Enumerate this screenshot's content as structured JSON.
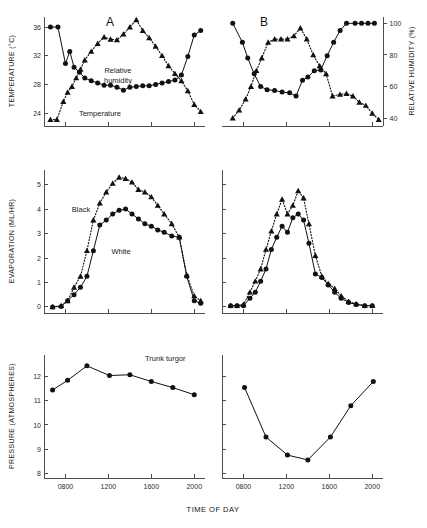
{
  "figure": {
    "panel_a_letter": "A",
    "panel_b_letter": "B",
    "x_axis_title": "TIME OF DAY",
    "y_axis_title_top": "TEMPERATURE (°C)",
    "y_axis_title_top_right": "RELATIVE HUMIDITY (%)",
    "y_axis_title_middle": "EVAPORATION (ML/HR)",
    "y_axis_title_bottom": "PRESSURE (ATMOSPHERES)",
    "annotations": {
      "relative_humidity": "Relative\nhumidity",
      "relative_humidity_line1": "Relative",
      "relative_humidity_line2": "humidity",
      "temperature": "Temperature",
      "black": "Black",
      "white": "White",
      "trunk_turgor": "Trunk turgor"
    }
  },
  "chart_data": [
    {
      "id": "panel-a-top",
      "type": "line",
      "title": "A",
      "xlabel": "TIME OF DAY",
      "ylabel": "TEMPERATURE (°C)",
      "xlim": [
        600,
        2100
      ],
      "ylim": [
        22.2,
        37.4
      ],
      "xticks": [
        800,
        1200,
        1600,
        2000
      ],
      "xticklabels": [
        "0800",
        "1200",
        "1600",
        "2000"
      ],
      "yticks": [
        24,
        28,
        32,
        36
      ],
      "yticklabels": [
        "24",
        "28",
        "32",
        "36"
      ],
      "grid": false,
      "legend": "inline-annotation",
      "series": [
        {
          "name": "Relative humidity",
          "marker": "circle",
          "linestyle": "solid",
          "x": [
            660,
            730,
            800,
            840,
            880,
            930,
            980,
            1040,
            1100,
            1160,
            1220,
            1280,
            1340,
            1400,
            1460,
            1520,
            1580,
            1640,
            1700,
            1760,
            1820,
            1880,
            1940,
            2000,
            2060
          ],
          "y": [
            36.0,
            36.0,
            30.9,
            32.6,
            30.4,
            29.7,
            28.9,
            28.5,
            28.2,
            27.9,
            27.9,
            27.6,
            27.2,
            27.6,
            27.7,
            27.8,
            27.8,
            28.0,
            28.2,
            28.4,
            28.6,
            29.3,
            31.9,
            34.9,
            35.5
          ]
        },
        {
          "name": "Temperature",
          "marker": "triangle",
          "linestyle": "dotted",
          "x": [
            660,
            720,
            780,
            820,
            860,
            900,
            940,
            980,
            1040,
            1100,
            1160,
            1220,
            1280,
            1340,
            1400,
            1460,
            1520,
            1580,
            1640,
            1700,
            1760,
            1820,
            1880,
            1940,
            2000,
            2060
          ],
          "y": [
            23.1,
            23.1,
            25.6,
            26.9,
            27.7,
            28.9,
            30.1,
            31.4,
            32.6,
            33.7,
            34.6,
            34.3,
            34.2,
            35.0,
            36.0,
            37.0,
            35.5,
            34.5,
            33.3,
            32.0,
            30.6,
            29.5,
            28.5,
            27.1,
            25.2,
            24.2
          ]
        }
      ]
    },
    {
      "id": "panel-b-top",
      "type": "line",
      "title": "B",
      "xlabel": "TIME OF DAY",
      "ylabel": "RELATIVE HUMIDITY (%)",
      "xlim": [
        600,
        2100
      ],
      "ylim": [
        35,
        104
      ],
      "xticks": [
        800,
        1200,
        1600,
        2000
      ],
      "xticklabels": [
        "0800",
        "1200",
        "1600",
        "2000"
      ],
      "yticks": [
        40,
        60,
        80,
        100
      ],
      "yticklabels": [
        "40",
        "60",
        "80",
        "100"
      ],
      "grid": false,
      "series": [
        {
          "name": "Relative humidity",
          "marker": "circle",
          "linestyle": "solid",
          "x": [
            700,
            790,
            840,
            900,
            960,
            1020,
            1090,
            1160,
            1230,
            1290,
            1350,
            1400,
            1460,
            1520,
            1580,
            1640,
            1700,
            1760,
            1840,
            1900,
            1960,
            2020
          ],
          "y": [
            100.0,
            88.0,
            78.0,
            68.0,
            60.0,
            58.0,
            57.5,
            56.5,
            56.0,
            54.0,
            64.0,
            66.0,
            70.0,
            70.5,
            79.5,
            88.0,
            95.5,
            100.0,
            100.0,
            100.0,
            100.0,
            100.0
          ]
        },
        {
          "name": "Temperature",
          "marker": "triangle",
          "linestyle": "dotted",
          "x": [
            700,
            760,
            820,
            870,
            920,
            970,
            1030,
            1090,
            1150,
            1210,
            1270,
            1330,
            1390,
            1450,
            1510,
            1570,
            1630,
            1700,
            1760,
            1820,
            1880,
            1940,
            2000,
            2060
          ],
          "y": [
            40.0,
            45.0,
            52.0,
            60.0,
            70.0,
            78.0,
            88.0,
            90.0,
            90.0,
            90.0,
            92.0,
            97.0,
            90.0,
            80.0,
            73.0,
            68.0,
            54.0,
            55.0,
            55.5,
            54.0,
            50.0,
            48.0,
            43.0,
            39.0
          ]
        }
      ]
    },
    {
      "id": "panel-a-middle",
      "type": "line",
      "title": "",
      "xlabel": "TIME OF DAY",
      "ylabel": "EVAPORATION (ML/HR)",
      "xlim": [
        600,
        2100
      ],
      "ylim": [
        -0.25,
        5.6
      ],
      "xticks": [
        800,
        1200,
        1600,
        2000
      ],
      "xticklabels": [
        "0800",
        "1200",
        "1600",
        "2000"
      ],
      "yticks": [
        0,
        1,
        2,
        3,
        4,
        5
      ],
      "yticklabels": [
        "0",
        "1",
        "2",
        "3",
        "4",
        "5"
      ],
      "grid": false,
      "series": [
        {
          "name": "Black",
          "marker": "triangle",
          "linestyle": "dotted",
          "x": [
            680,
            760,
            820,
            880,
            940,
            1000,
            1060,
            1120,
            1180,
            1240,
            1300,
            1360,
            1420,
            1480,
            1540,
            1600,
            1660,
            1720,
            1790,
            1860,
            1930,
            2000,
            2060
          ],
          "y": [
            0.0,
            0.05,
            0.25,
            0.8,
            1.25,
            2.3,
            3.55,
            4.25,
            4.7,
            5.05,
            5.3,
            5.25,
            5.1,
            4.8,
            4.7,
            4.5,
            4.15,
            3.8,
            3.4,
            2.85,
            1.3,
            0.45,
            0.25
          ]
        },
        {
          "name": "White",
          "marker": "circle",
          "linestyle": "solid",
          "x": [
            680,
            760,
            820,
            880,
            940,
            1000,
            1060,
            1120,
            1180,
            1240,
            1300,
            1360,
            1420,
            1480,
            1540,
            1600,
            1660,
            1720,
            1790,
            1860,
            1930,
            2000,
            2060
          ],
          "y": [
            0.0,
            0.02,
            0.25,
            0.5,
            0.8,
            1.25,
            2.3,
            3.35,
            3.55,
            3.8,
            3.95,
            4.0,
            3.8,
            3.6,
            3.4,
            3.3,
            3.15,
            3.05,
            2.9,
            2.85,
            1.25,
            0.25,
            0.15
          ]
        }
      ]
    },
    {
      "id": "panel-b-middle",
      "type": "line",
      "title": "",
      "xlabel": "TIME OF DAY",
      "ylabel": "EVAPORATION (ML/HR)",
      "xlim": [
        600,
        2100
      ],
      "ylim": [
        -0.25,
        5.6
      ],
      "xticks": [
        800,
        1200,
        1600,
        2000
      ],
      "xticklabels": [
        "0800",
        "1200",
        "1600",
        "2000"
      ],
      "yticks": [
        0,
        1,
        2,
        3,
        4,
        5
      ],
      "yticklabels": [
        "0",
        "1",
        "2",
        "3",
        "4",
        "5"
      ],
      "grid": false,
      "series": [
        {
          "name": "Black",
          "marker": "triangle",
          "linestyle": "dotted",
          "x": [
            680,
            740,
            800,
            860,
            910,
            960,
            1010,
            1060,
            1110,
            1160,
            1210,
            1260,
            1310,
            1360,
            1410,
            1470,
            1530,
            1590,
            1650,
            1710,
            1780,
            1850,
            1930,
            2000
          ],
          "y": [
            0.05,
            0.05,
            0.1,
            0.6,
            1.05,
            1.55,
            2.35,
            3.1,
            3.8,
            4.4,
            3.8,
            4.15,
            4.75,
            4.45,
            3.4,
            2.1,
            1.25,
            0.95,
            0.75,
            0.45,
            0.22,
            0.12,
            0.05,
            0.05
          ]
        },
        {
          "name": "White",
          "marker": "circle",
          "linestyle": "solid",
          "x": [
            680,
            740,
            800,
            860,
            910,
            960,
            1010,
            1060,
            1110,
            1160,
            1210,
            1260,
            1310,
            1360,
            1410,
            1470,
            1530,
            1590,
            1650,
            1710,
            1780,
            1850,
            1930,
            2000
          ],
          "y": [
            0.05,
            0.05,
            0.05,
            0.35,
            0.6,
            1.05,
            1.55,
            2.35,
            2.85,
            3.3,
            3.05,
            3.65,
            3.8,
            3.55,
            2.6,
            1.35,
            1.2,
            0.9,
            0.6,
            0.35,
            0.18,
            0.1,
            0.05,
            0.05
          ]
        }
      ]
    },
    {
      "id": "panel-a-bottom",
      "type": "line",
      "title": "",
      "xlabel": "TIME OF DAY",
      "ylabel": "PRESSURE (ATMOSPHERES)",
      "xlim": [
        600,
        2100
      ],
      "ylim": [
        7.8,
        12.9
      ],
      "xticks": [
        800,
        1200,
        1600,
        2000
      ],
      "xticklabels": [
        "0800",
        "1200",
        "1600",
        "2000"
      ],
      "yticks": [
        8,
        9,
        10,
        11,
        12
      ],
      "yticklabels": [
        "8",
        "9",
        "10",
        "11",
        "12"
      ],
      "grid": false,
      "series": [
        {
          "name": "Trunk turgor",
          "marker": "circle",
          "linestyle": "solid",
          "x": [
            680,
            820,
            1000,
            1210,
            1400,
            1600,
            1800,
            2000
          ],
          "y": [
            11.45,
            11.85,
            12.45,
            12.05,
            12.08,
            11.8,
            11.55,
            11.25
          ]
        }
      ]
    },
    {
      "id": "panel-b-bottom",
      "type": "line",
      "title": "",
      "xlabel": "TIME OF DAY",
      "ylabel": "PRESSURE (ATMOSPHERES)",
      "xlim": [
        600,
        2100
      ],
      "ylim": [
        7.8,
        12.9
      ],
      "xticks": [
        800,
        1200,
        1600,
        2000
      ],
      "xticklabels": [
        "0800",
        "1200",
        "1600",
        "2000"
      ],
      "yticks": [
        8,
        9,
        10,
        11,
        12
      ],
      "yticklabels": [
        "8",
        "9",
        "10",
        "11",
        "12"
      ],
      "grid": false,
      "series": [
        {
          "name": "Trunk turgor",
          "marker": "circle",
          "linestyle": "solid",
          "x": [
            810,
            1010,
            1210,
            1400,
            1610,
            1800,
            2010
          ],
          "y": [
            11.55,
            9.5,
            8.75,
            8.55,
            9.5,
            10.8,
            11.8
          ]
        }
      ]
    }
  ]
}
